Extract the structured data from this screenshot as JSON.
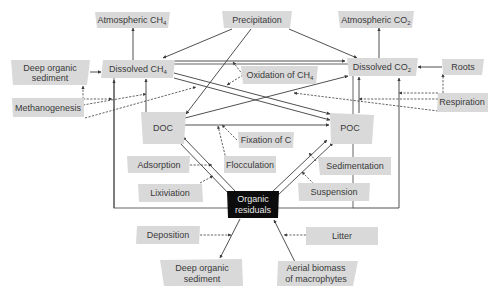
{
  "diagram": {
    "title": "",
    "nodes": {
      "atm_ch4": {
        "label": "Atmospheric CH",
        "sub": "4"
      },
      "precipitation": {
        "label": "Precipitation"
      },
      "atm_co2": {
        "label": "Atmospheric CO",
        "sub": "2"
      },
      "deep_sed_top": {
        "line1": "Deep organic",
        "line2": "sediment"
      },
      "dissolved_ch4": {
        "label": "Dissolved CH",
        "sub": "4"
      },
      "oxidation_ch4": {
        "label": "Oxidation of CH",
        "sub": "4"
      },
      "dissolved_co2": {
        "label": "Dissolved CO",
        "sub": "2"
      },
      "roots": {
        "label": "Roots"
      },
      "methanogenesis": {
        "label": "Methanogenesis"
      },
      "respiration": {
        "label": "Respiration"
      },
      "doc": {
        "label": "DOC"
      },
      "poc": {
        "label": "POC"
      },
      "fixation_c": {
        "label": "Fixation of C"
      },
      "adsorption": {
        "label": "Adsorption"
      },
      "flocculation": {
        "label": "Flocculation"
      },
      "sedimentation": {
        "label": "Sedimentation"
      },
      "lixiviation": {
        "label": "Lixiviation"
      },
      "suspension": {
        "label": "Suspension"
      },
      "organic_residuals": {
        "line1": "Organic",
        "line2": "residuals"
      },
      "deposition": {
        "label": "Deposition"
      },
      "litter": {
        "label": "Litter"
      },
      "deep_sed_bottom": {
        "line1": "Deep organic",
        "line2": "sediment"
      },
      "aerial_biomass": {
        "line1": "Aerial biomass",
        "line2": "of macrophytes"
      }
    },
    "edges": [
      {
        "from": "Dissolved CH4",
        "to": "Atmospheric CH4",
        "style": "solid"
      },
      {
        "from": "Dissolved CO2",
        "to": "Atmospheric CO2",
        "style": "solid"
      },
      {
        "from": "Precipitation",
        "to": "Dissolved CH4",
        "style": "solid"
      },
      {
        "from": "Precipitation",
        "to": "Dissolved CO2",
        "style": "solid"
      },
      {
        "from": "Precipitation",
        "to": "DOC",
        "style": "solid"
      },
      {
        "from": "Deep organic sediment",
        "to": "Dissolved CH4",
        "style": "solid"
      },
      {
        "from": "Dissolved CH4",
        "to": "Dissolved CO2",
        "style": "solid"
      },
      {
        "from": "Roots",
        "to": "Dissolved CO2",
        "style": "solid"
      },
      {
        "from": "Dissolved CH4",
        "to": "POC",
        "style": "solid"
      },
      {
        "from": "DOC",
        "to": "Dissolved CH4",
        "style": "solid"
      },
      {
        "from": "DOC",
        "to": "Dissolved CO2",
        "style": "solid"
      },
      {
        "from": "DOC",
        "to": "POC",
        "style": "solid"
      },
      {
        "from": "POC",
        "to": "Dissolved CO2",
        "style": "solid"
      },
      {
        "from": "Organic residuals",
        "to": "DOC",
        "style": "solid"
      },
      {
        "from": "Organic residuals",
        "to": "POC",
        "style": "solid"
      },
      {
        "from": "Organic residuals",
        "to": "Dissolved CH4",
        "style": "solid"
      },
      {
        "from": "Organic residuals",
        "to": "Dissolved CO2",
        "style": "solid"
      },
      {
        "from": "Organic residuals",
        "to": "Deep organic sediment",
        "style": "solid"
      },
      {
        "from": "Aerial biomass of macrophytes",
        "to": "Organic residuals",
        "style": "solid"
      },
      {
        "from": "Methanogenesis",
        "style": "dashed"
      },
      {
        "from": "Respiration",
        "style": "dashed"
      },
      {
        "from": "Oxidation of CH4",
        "style": "dashed"
      },
      {
        "from": "Fixation of C",
        "style": "dashed"
      },
      {
        "from": "Adsorption",
        "style": "dashed"
      },
      {
        "from": "Flocculation",
        "style": "dashed"
      },
      {
        "from": "Lixiviation",
        "style": "dashed"
      },
      {
        "from": "Sedimentation",
        "style": "dashed"
      },
      {
        "from": "Suspension",
        "style": "dashed"
      },
      {
        "from": "Deposition",
        "style": "dashed"
      },
      {
        "from": "Litter",
        "style": "dashed"
      }
    ],
    "colors": {
      "box": "#d9d9d9",
      "box_dark": "#0c0c0c",
      "line": "#3c3c3c",
      "text": "#3a3a3a"
    }
  }
}
